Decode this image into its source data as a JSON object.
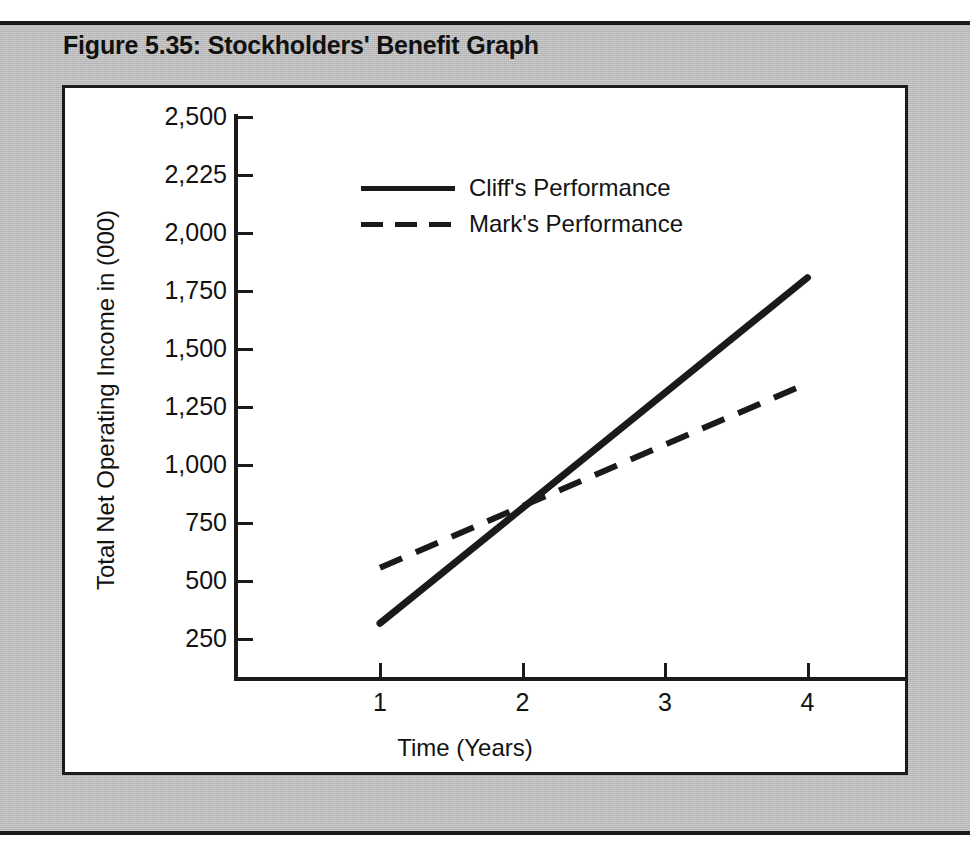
{
  "figure": {
    "title": "Figure 5.35: Stockholders' Benefit Graph",
    "background_color": "#b9b9b9",
    "panel_color": "#ffffff",
    "ink_color": "#1a1a1a"
  },
  "chart_data": {
    "type": "line",
    "title": "Figure 5.35: Stockholders' Benefit Graph",
    "xlabel": "Time (Years)",
    "ylabel": "Total Net Operating Income in (000)",
    "x": [
      1,
      4
    ],
    "xticklabels": [
      "1",
      "2",
      "3",
      "4"
    ],
    "xtickvalues": [
      1,
      2,
      3,
      4
    ],
    "xlim": [
      0.55,
      4.35
    ],
    "yticklabels": [
      "2,500",
      "2,225",
      "2,000",
      "1,750",
      "1,500",
      "1,250",
      "1,000",
      "750",
      "500",
      "250"
    ],
    "ytickvalues": [
      2500,
      2250,
      2000,
      1750,
      1500,
      1250,
      1000,
      750,
      500,
      250
    ],
    "ylim": [
      250,
      2500
    ],
    "grid": false,
    "legend_position": "upper center",
    "series": [
      {
        "name": "Cliff's Performance",
        "style": "solid",
        "color": "#1a1a1a",
        "x": [
          1,
          4
        ],
        "values": [
          490,
          1980
        ]
      },
      {
        "name": "Mark's Performance",
        "style": "dashed",
        "color": "#1a1a1a",
        "x": [
          1,
          4
        ],
        "values": [
          730,
          1525
        ]
      }
    ],
    "annotations": [
      {
        "text": "crossover",
        "x": 2.15,
        "y": 1030
      }
    ]
  },
  "legend": {
    "entries": [
      {
        "label": "Cliff's Performance",
        "style": "solid"
      },
      {
        "label": "Mark's Performance",
        "style": "dashed"
      }
    ]
  }
}
